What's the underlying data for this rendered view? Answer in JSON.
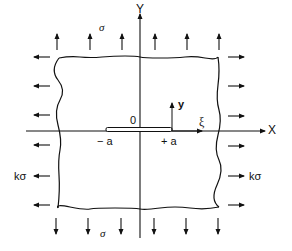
{
  "diagram": {
    "axes": {
      "global_x_label": "X",
      "global_y_label": "Y",
      "origin_label": "0",
      "local_y_label": "y",
      "local_xi_label": "ξ"
    },
    "crack": {
      "left_tip_label": "− a",
      "right_tip_label": "+ a"
    },
    "loads": {
      "top_label": "σ",
      "bottom_label": "σ",
      "left_label": "kσ",
      "right_label": "kσ",
      "top_arrow_count": 6,
      "bottom_arrow_count": 6,
      "left_arrow_count": 6,
      "right_arrow_count": 6
    },
    "colors": {
      "ink": "#111111",
      "background": "#ffffff"
    }
  }
}
